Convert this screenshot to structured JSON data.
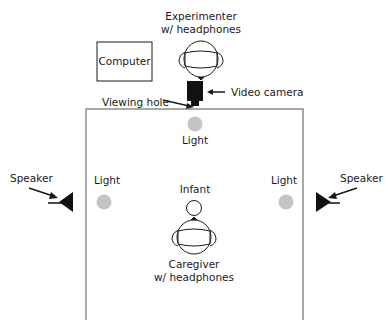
{
  "diagram": {
    "type": "experimental-setup-floorplan",
    "labels": {
      "experimenter_line1": "Experimenter",
      "experimenter_line2": "w/ headphones",
      "computer": "Computer",
      "viewing_hole": "Viewing hole",
      "video_camera": "Video camera",
      "light_top": "Light",
      "light_left": "Light",
      "light_right": "Light",
      "speaker_left": "Speaker",
      "speaker_right": "Speaker",
      "infant": "Infant",
      "caregiver_line1": "Caregiver",
      "caregiver_line2": "w/ headphones"
    },
    "colors": {
      "line": "#1a1a1a",
      "wall": "#8c8c8c",
      "light": "#c4c4c4"
    }
  }
}
